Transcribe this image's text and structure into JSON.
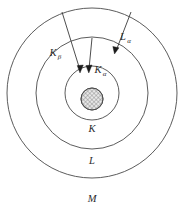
{
  "diagram": {
    "shells": [
      {
        "id": "K",
        "label": "K",
        "radius": 27,
        "label_x": 92,
        "label_y": 132
      },
      {
        "id": "L",
        "label": "L",
        "radius": 56,
        "label_x": 92,
        "label_y": 164
      },
      {
        "id": "M",
        "label": "M",
        "radius": 85,
        "label_x": 92,
        "label_y": 202
      }
    ],
    "nucleus": {
      "label": "nucleus",
      "radius": 11,
      "fill_pattern": "cross-hatch",
      "fill_color": "#d8d8d8"
    },
    "center": {
      "x": 92,
      "y": 93
    },
    "transitions": [
      {
        "id": "K-beta",
        "label_main": "K",
        "label_sub": "β",
        "from_shell": "M",
        "to_shell": "K",
        "label_x": 57,
        "label_y": 56
      },
      {
        "id": "K-alpha",
        "label_main": "K",
        "label_sub": "α",
        "from_shell": "L",
        "to_shell": "K",
        "label_x": 101,
        "label_y": 73
      },
      {
        "id": "L-alpha",
        "label_main": "L",
        "label_sub": "α",
        "from_shell": "M",
        "to_shell": "L",
        "label_x": 126,
        "label_y": 40
      }
    ],
    "colors": {
      "stroke": "#4a4a4a",
      "arrow": "#1c1c1c",
      "text": "#2b2b2b",
      "background": "#ffffff",
      "nucleus_fill": "#d8d8d8"
    }
  }
}
